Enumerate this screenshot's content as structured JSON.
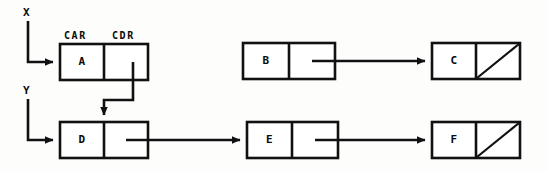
{
  "diagram": {
    "stroke_color": "#111111",
    "background_color": "#fdfdfc",
    "field_labels": {
      "car": "CAR",
      "cdr": "CDR"
    },
    "variables": [
      {
        "name": "X",
        "label": "X",
        "points_to": "A"
      },
      {
        "name": "Y",
        "label": "Y",
        "points_to": "D"
      }
    ],
    "cells": [
      {
        "id": "A",
        "label": "A",
        "car": "A",
        "cdr_nil": false,
        "x": 60,
        "y": 44,
        "w": 88,
        "h": 36
      },
      {
        "id": "B",
        "label": "B",
        "car": "B",
        "cdr_nil": false,
        "x": 243,
        "y": 43,
        "w": 92,
        "h": 36
      },
      {
        "id": "C",
        "label": "C",
        "car": "C",
        "cdr_nil": true,
        "x": 432,
        "y": 43,
        "w": 88,
        "h": 36
      },
      {
        "id": "D",
        "label": "D",
        "car": "D",
        "cdr_nil": false,
        "x": 60,
        "y": 122,
        "w": 88,
        "h": 36
      },
      {
        "id": "E",
        "label": "E",
        "car": "E",
        "cdr_nil": false,
        "x": 247,
        "y": 122,
        "w": 91,
        "h": 36
      },
      {
        "id": "F",
        "label": "F",
        "car": "F",
        "cdr_nil": true,
        "x": 432,
        "y": 122,
        "w": 88,
        "h": 36
      }
    ],
    "pointers": [
      {
        "from": "X",
        "to": "A",
        "kind": "variable-arrow"
      },
      {
        "from": "Y",
        "to": "D",
        "kind": "variable-arrow"
      },
      {
        "from": "A.cdr",
        "to": "D",
        "kind": "cdr-arrow-down"
      },
      {
        "from": "B.cdr",
        "to": "C",
        "kind": "cdr-arrow-right"
      },
      {
        "from": "D.cdr",
        "to": "E",
        "kind": "cdr-arrow-right"
      },
      {
        "from": "E.cdr",
        "to": "F",
        "kind": "cdr-arrow-right"
      }
    ]
  }
}
